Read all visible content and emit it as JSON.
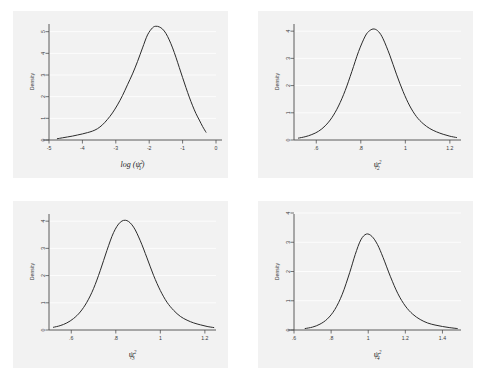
{
  "figure": {
    "background_color": "#ffffff",
    "panel_color": "#f2f2f2",
    "curve_color": "#2b2b2b",
    "grid_color": "#ffffff",
    "axis_color": "#4a4a4a",
    "panel_count": 4,
    "layout": "2x2"
  },
  "chart_data": [
    {
      "id": "panel-1",
      "type": "line",
      "title": "",
      "xlabel": "log (ψ²₁)",
      "xlabel_parts": {
        "prefix": "log (",
        "symbol": "ψ",
        "sup": "2",
        "sub": "1",
        "suffix": ")"
      },
      "ylabel": "Density",
      "xlim": [
        -5,
        0
      ],
      "ylim": [
        0,
        5.4
      ],
      "xticks": [
        -5,
        -4,
        -3,
        -2,
        -1,
        0
      ],
      "xticklabels": [
        "-5",
        "-4",
        "-3",
        "-2",
        "-1",
        "0"
      ],
      "yticks": [
        0,
        1,
        2,
        3,
        4,
        5
      ],
      "yticklabels": [
        "0",
        "1",
        "2",
        "3",
        "4",
        "5"
      ],
      "grid": "horizontal",
      "legend": "none",
      "series": [
        {
          "name": "Density of log (ψ²₁)",
          "x": [
            -4.75,
            -4.6,
            -4.45,
            -4.3,
            -4.15,
            -4.0,
            -3.85,
            -3.7,
            -3.55,
            -3.4,
            -3.25,
            -3.1,
            -2.95,
            -2.8,
            -2.65,
            -2.5,
            -2.35,
            -2.2,
            -2.05,
            -1.9,
            -1.8,
            -1.7,
            -1.6,
            -1.5,
            -1.4,
            -1.3,
            -1.2,
            -1.1,
            -1.0,
            -0.9,
            -0.8,
            -0.7,
            -0.6,
            -0.5,
            -0.4,
            -0.3
          ],
          "y": [
            0.06,
            0.1,
            0.14,
            0.18,
            0.23,
            0.28,
            0.34,
            0.41,
            0.52,
            0.7,
            0.95,
            1.25,
            1.62,
            2.05,
            2.55,
            3.05,
            3.62,
            4.25,
            4.85,
            5.18,
            5.25,
            5.22,
            5.12,
            4.92,
            4.62,
            4.25,
            3.82,
            3.35,
            2.88,
            2.42,
            1.98,
            1.58,
            1.22,
            0.92,
            0.62,
            0.36
          ]
        }
      ]
    },
    {
      "id": "panel-2",
      "type": "line",
      "title": "",
      "xlabel": "ψ²₂",
      "xlabel_parts": {
        "prefix": "",
        "symbol": "ψ",
        "sup": "2",
        "sub": "2",
        "suffix": ""
      },
      "ylabel": "Density",
      "xlim": [
        0.5,
        1.25
      ],
      "ylim": [
        0,
        4.3
      ],
      "xticks": [
        0.6,
        0.8,
        1.0,
        1.2
      ],
      "xticklabels": [
        ".6",
        ".8",
        "1",
        "1.2"
      ],
      "yticks": [
        0,
        1,
        2,
        3,
        4
      ],
      "yticklabels": [
        "0",
        "1",
        "2",
        "3",
        "4"
      ],
      "grid": "horizontal",
      "legend": "none",
      "series": [
        {
          "name": "Density of ψ²₂",
          "x": [
            0.52,
            0.55,
            0.58,
            0.61,
            0.64,
            0.67,
            0.7,
            0.73,
            0.76,
            0.79,
            0.82,
            0.84,
            0.86,
            0.88,
            0.9,
            0.93,
            0.96,
            0.99,
            1.02,
            1.05,
            1.08,
            1.11,
            1.14,
            1.17,
            1.2,
            1.23
          ],
          "y": [
            0.07,
            0.12,
            0.2,
            0.32,
            0.52,
            0.82,
            1.25,
            1.82,
            2.52,
            3.25,
            3.82,
            4.02,
            4.08,
            3.98,
            3.72,
            3.12,
            2.42,
            1.78,
            1.25,
            0.86,
            0.6,
            0.42,
            0.3,
            0.21,
            0.14,
            0.09
          ]
        }
      ]
    },
    {
      "id": "panel-3",
      "type": "line",
      "title": "",
      "xlabel": "ψ²₃",
      "xlabel_parts": {
        "prefix": "",
        "symbol": "ψ",
        "sup": "2",
        "sub": "3",
        "suffix": ""
      },
      "ylabel": "Density",
      "xlim": [
        0.5,
        1.25
      ],
      "ylim": [
        0,
        4.3
      ],
      "xticks": [
        0.6,
        0.8,
        1.0,
        1.2
      ],
      "xticklabels": [
        ".6",
        ".8",
        "1",
        "1.2"
      ],
      "yticks": [
        0,
        1,
        2,
        3,
        4
      ],
      "yticklabels": [
        "0",
        "1",
        "2",
        "3",
        "4"
      ],
      "grid": "horizontal",
      "legend": "none",
      "series": [
        {
          "name": "Density of ψ²₃",
          "x": [
            0.52,
            0.55,
            0.58,
            0.61,
            0.64,
            0.67,
            0.7,
            0.73,
            0.76,
            0.79,
            0.82,
            0.85,
            0.88,
            0.91,
            0.94,
            0.97,
            1.0,
            1.03,
            1.06,
            1.09,
            1.12,
            1.15,
            1.18,
            1.21,
            1.24
          ],
          "y": [
            0.1,
            0.16,
            0.26,
            0.42,
            0.66,
            1.02,
            1.52,
            2.18,
            2.92,
            3.58,
            3.96,
            4.02,
            3.78,
            3.28,
            2.65,
            2.0,
            1.45,
            1.02,
            0.72,
            0.5,
            0.36,
            0.26,
            0.19,
            0.13,
            0.09
          ]
        }
      ]
    },
    {
      "id": "panel-4",
      "type": "line",
      "title": "",
      "xlabel": "ψ²₄",
      "xlabel_parts": {
        "prefix": "",
        "symbol": "ψ",
        "sup": "2",
        "sub": "4",
        "suffix": ""
      },
      "ylabel": "Density",
      "xlim": [
        0.6,
        1.5
      ],
      "ylim": [
        0,
        4.0
      ],
      "xticks": [
        0.6,
        0.8,
        1.0,
        1.2,
        1.4
      ],
      "xticklabels": [
        ".6",
        ".8",
        "1",
        "1.2",
        "1.4"
      ],
      "yticks": [
        0,
        1,
        2,
        3,
        4
      ],
      "yticklabels": [
        "0",
        "1",
        "2",
        "3",
        "4"
      ],
      "grid": "horizontal",
      "legend": "none",
      "series": [
        {
          "name": "Density of ψ²₄",
          "x": [
            0.66,
            0.7,
            0.74,
            0.78,
            0.82,
            0.86,
            0.9,
            0.93,
            0.96,
            0.99,
            1.02,
            1.05,
            1.08,
            1.12,
            1.16,
            1.2,
            1.24,
            1.28,
            1.32,
            1.36,
            1.4,
            1.44,
            1.48
          ],
          "y": [
            0.05,
            0.1,
            0.2,
            0.38,
            0.7,
            1.22,
            1.96,
            2.58,
            3.08,
            3.28,
            3.2,
            2.92,
            2.48,
            1.82,
            1.24,
            0.82,
            0.54,
            0.36,
            0.24,
            0.17,
            0.12,
            0.08,
            0.05
          ]
        }
      ]
    }
  ]
}
